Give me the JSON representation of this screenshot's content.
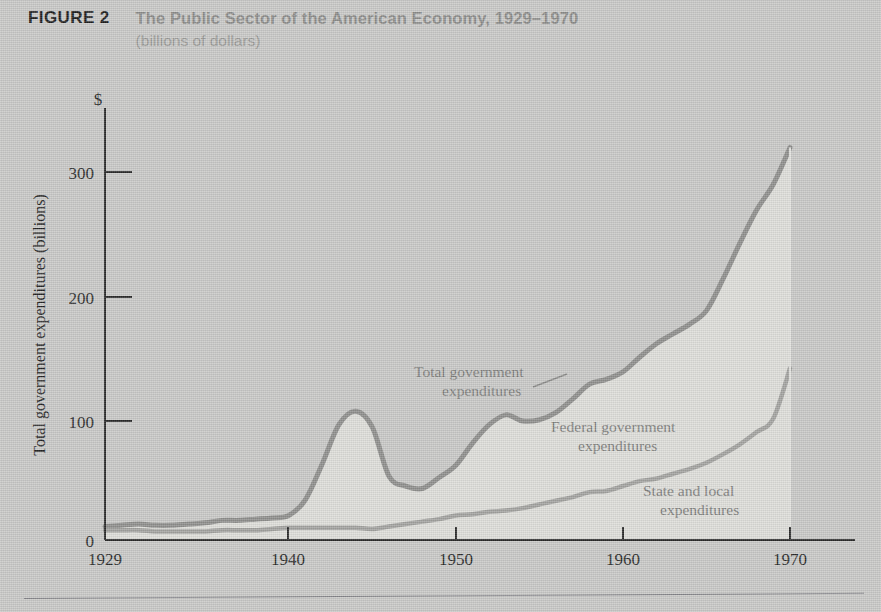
{
  "header": {
    "figure_label": "FIGURE 2",
    "title": "The Public Sector of the American Economy, 1929–1970",
    "subtitle": "(billions of dollars)"
  },
  "colors": {
    "page_background": "#c9c9c7",
    "plot_fill": "#dedeba",
    "line_stroke": "#8f8f8d",
    "axis_stroke": "#2a2a2a",
    "title_muted": "#8c8c8a",
    "figure_label": "#1d1d1d"
  },
  "axes": {
    "y_axis_title": "Total government expenditures (billions)",
    "y_currency_symbol": "$",
    "y_ticks": [
      "0",
      "100",
      "200",
      "300"
    ],
    "y_tick_values": [
      0,
      100,
      200,
      300
    ],
    "x_ticks": [
      "1929",
      "1940",
      "1950",
      "1960",
      "1970"
    ],
    "x_tick_values": [
      1929,
      1940,
      1950,
      1960,
      1970
    ],
    "xlim": [
      1929,
      1970
    ],
    "ylim": [
      0,
      345
    ]
  },
  "series_labels": {
    "total": "Total government\nexpenditures",
    "total_line1": "Total government",
    "total_line2": "expenditures",
    "federal_line1": "Federal government",
    "federal_line2": "expenditures",
    "state_line1": "State and local",
    "state_line2": "expenditures"
  },
  "chart_data": {
    "type": "area",
    "title": "The Public Sector of the American Economy, 1929–1970",
    "subtitle": "(billions of dollars)",
    "xlabel": "",
    "ylabel": "Total government expenditures (billions)",
    "xlim": [
      1929,
      1970
    ],
    "ylim": [
      0,
      345
    ],
    "grid": false,
    "legend": "inline-annotations",
    "units": "billions of dollars",
    "x": [
      1929,
      1930,
      1931,
      1932,
      1933,
      1934,
      1935,
      1936,
      1937,
      1938,
      1939,
      1940,
      1941,
      1942,
      1943,
      1944,
      1945,
      1946,
      1947,
      1948,
      1949,
      1950,
      1951,
      1952,
      1953,
      1954,
      1955,
      1956,
      1957,
      1958,
      1959,
      1960,
      1961,
      1962,
      1963,
      1964,
      1965,
      1966,
      1967,
      1968,
      1969,
      1970
    ],
    "series": [
      {
        "name": "Total government expenditures",
        "label_line1": "Total government",
        "label_line2": "expenditures",
        "values": [
          11,
          12,
          13,
          12,
          12,
          13,
          14,
          16,
          16,
          17,
          18,
          20,
          33,
          62,
          94,
          105,
          92,
          52,
          44,
          42,
          51,
          61,
          79,
          94,
          102,
          97,
          98,
          104,
          115,
          127,
          131,
          137,
          149,
          160,
          168,
          176,
          187,
          213,
          242,
          269,
          290,
          320
        ]
      },
      {
        "name": "Federal government expenditures",
        "label_line1": "Federal government",
        "label_line2": "expenditures",
        "note": "Region between total and state-and-local curves",
        "values": [
          3,
          4,
          5,
          5,
          5,
          6,
          7,
          8,
          8,
          9,
          9,
          10,
          23,
          52,
          84,
          95,
          83,
          41,
          31,
          27,
          34,
          41,
          58,
          71,
          78,
          71,
          69,
          72,
          80,
          88,
          91,
          93,
          101,
          110,
          114,
          118,
          124,
          143,
          164,
          181,
          191,
          180
        ]
      },
      {
        "name": "State and local expenditures",
        "label_line1": "State and local",
        "label_line2": "expenditures",
        "values": [
          8,
          8,
          8,
          7,
          7,
          7,
          7,
          8,
          8,
          8,
          9,
          10,
          10,
          10,
          10,
          10,
          9,
          11,
          13,
          15,
          17,
          20,
          21,
          23,
          24,
          26,
          29,
          32,
          35,
          39,
          40,
          44,
          48,
          50,
          54,
          58,
          63,
          70,
          78,
          88,
          99,
          140
        ]
      }
    ],
    "annotations": [
      {
        "text": "Total government expenditures",
        "x": 1952,
        "y": 148,
        "leader_to": [
          1957,
          133
        ]
      },
      {
        "text": "Federal government expenditures",
        "x": 1957.5,
        "y": 112
      },
      {
        "text": "State and local expenditures",
        "x": 1963.5,
        "y": 38
      }
    ]
  }
}
